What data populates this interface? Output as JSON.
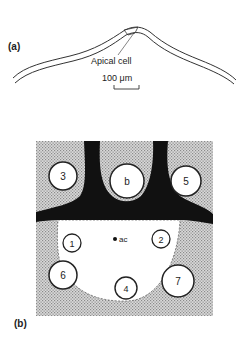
{
  "panel_a": {
    "label": "(a)",
    "callout": "Apical cell",
    "scale_bar": "100 μm"
  },
  "panel_b": {
    "label": "(b)",
    "center_marker": "ac",
    "circles": [
      {
        "id": "3",
        "label": "3"
      },
      {
        "id": "b",
        "label": "b"
      },
      {
        "id": "5",
        "label": "5"
      },
      {
        "id": "1",
        "label": "1"
      },
      {
        "id": "2",
        "label": "2"
      },
      {
        "id": "6",
        "label": "6"
      },
      {
        "id": "4",
        "label": "4"
      },
      {
        "id": "7",
        "label": "7"
      }
    ]
  },
  "colors": {
    "ink": "#222222",
    "black_tissue": "#111111",
    "stipple": "#bdbdbd",
    "background": "#ffffff"
  }
}
